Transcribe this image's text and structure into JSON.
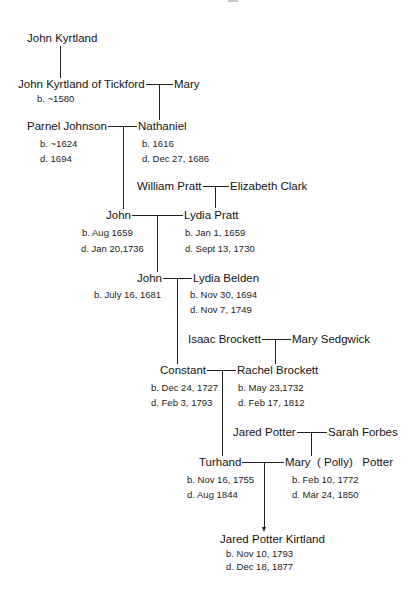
{
  "diagram": {
    "type": "family-tree",
    "generations": [
      {
        "couple": null,
        "person": {
          "name": "John Kyrtland"
        }
      },
      {
        "left": {
          "name": "John Kyrtland of Tickford",
          "born": "b. ~1580"
        },
        "right": {
          "name": "Mary"
        }
      },
      {
        "left": {
          "name": "Parnel Johnson",
          "born": "b. ~1624",
          "died": "d. 1694"
        },
        "right": {
          "name": "Nathaniel",
          "born": "b. 1616",
          "died": "d. Dec 27, 1686"
        }
      },
      {
        "parents": {
          "left": {
            "name": "William Pratt"
          },
          "right": {
            "name": "Elizabeth Clark"
          }
        },
        "left": {
          "name": "John",
          "born": "b. Aug 1659",
          "died": "d. Jan 20,1736"
        },
        "right": {
          "name": "Lydia Pratt",
          "born": "b. Jan 1, 1659",
          "died": "d. Sept 13, 1730"
        }
      },
      {
        "left": {
          "name": "John",
          "born": "b. July 16, 1681"
        },
        "right": {
          "name": "Lydia Belden",
          "born": "b. Nov 30, 1694",
          "died": "d. Nov 7, 1749"
        }
      },
      {
        "parents": {
          "left": {
            "name": "Isaac Brockett"
          },
          "right": {
            "name": "Mary Sedgwick"
          }
        },
        "left": {
          "name": "Constant",
          "born": "b. Dec 24, 1727",
          "died": "d. Feb 3, 1793"
        },
        "right": {
          "name": "Rachel Brockett",
          "born": "b. May 23,1732",
          "died": "d. Feb 17, 1812"
        }
      },
      {
        "parents": {
          "left": {
            "name": "Jared Potter"
          },
          "right": {
            "name": "Sarah Forbes"
          }
        },
        "left": {
          "name": "Turhand",
          "born": "b. Nov 16, 1755",
          "died": "d. Aug 1844"
        },
        "right": {
          "name": "Mary  ( Polly)   Potter",
          "born": "b. Feb 10, 1772",
          "died": "d. Mar 24, 1850"
        }
      },
      {
        "person": {
          "name": "Jared Potter Kirtland",
          "born": "b. Nov 10, 1793",
          "died": "d. Dec 18, 1877"
        }
      }
    ]
  },
  "colors": {
    "background": "#ffffff",
    "text": "#141414",
    "lines": "#202020"
  }
}
